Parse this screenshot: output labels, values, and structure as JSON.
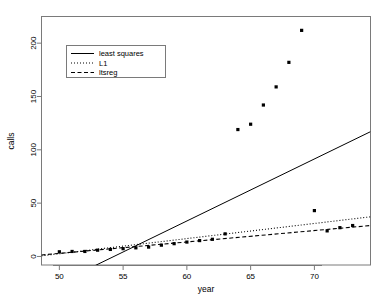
{
  "chart_data": {
    "type": "scatter",
    "title": "",
    "xlabel": "year",
    "ylabel": "calls",
    "xlim": [
      48.6,
      74.4
    ],
    "ylim": [
      -8,
      225
    ],
    "xticks": [
      50,
      55,
      60,
      65,
      70
    ],
    "yticks": [
      0,
      50,
      100,
      150,
      200
    ],
    "grid": false,
    "legend_position": "top-left",
    "points": [
      {
        "x": 50,
        "y": 4.4
      },
      {
        "x": 51,
        "y": 4.7
      },
      {
        "x": 52,
        "y": 4.7
      },
      {
        "x": 53,
        "y": 5.9
      },
      {
        "x": 54,
        "y": 6.6
      },
      {
        "x": 55,
        "y": 7.3
      },
      {
        "x": 56,
        "y": 8.1
      },
      {
        "x": 57,
        "y": 8.8
      },
      {
        "x": 58,
        "y": 10.6
      },
      {
        "x": 59,
        "y": 12.0
      },
      {
        "x": 60,
        "y": 13.5
      },
      {
        "x": 61,
        "y": 14.9
      },
      {
        "x": 62,
        "y": 16.1
      },
      {
        "x": 63,
        "y": 21.2
      },
      {
        "x": 64,
        "y": 119.0
      },
      {
        "x": 65,
        "y": 124.0
      },
      {
        "x": 66,
        "y": 142.0
      },
      {
        "x": 67,
        "y": 159.0
      },
      {
        "x": 68,
        "y": 182.0
      },
      {
        "x": 69,
        "y": 212.0
      },
      {
        "x": 70,
        "y": 43.0
      },
      {
        "x": 71,
        "y": 24.0
      },
      {
        "x": 72,
        "y": 27.0
      },
      {
        "x": 73,
        "y": 29.0
      }
    ],
    "series": [
      {
        "name": "least squares",
        "style": "solid",
        "x1": 48.6,
        "y1": -33.0,
        "x2": 74.4,
        "y2": 117.0
      },
      {
        "name": "L1",
        "style": "dotted",
        "x1": 48.6,
        "y1": 0.6,
        "x2": 74.4,
        "y2": 37.2
      },
      {
        "name": "ltsreg",
        "style": "dashed",
        "x1": 48.6,
        "y1": 1.4,
        "x2": 74.4,
        "y2": 29.0
      }
    ],
    "legend": [
      {
        "label": "least squares",
        "style": "solid"
      },
      {
        "label": "L1",
        "style": "dotted"
      },
      {
        "label": "ltsreg",
        "style": "dashed"
      }
    ],
    "colors": {
      "point": "#000000",
      "line": "#000000",
      "axis": "#7a7a7a",
      "background": "#ffffff"
    }
  }
}
